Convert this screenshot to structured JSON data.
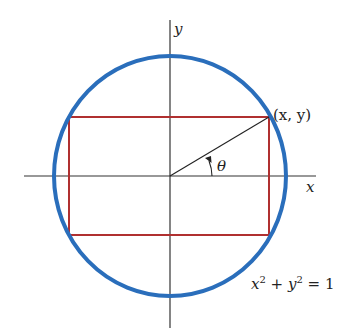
{
  "diagram": {
    "type": "geometry",
    "colors": {
      "circle": "#2a6ebb",
      "rectangle": "#b03030",
      "axes": "#333333",
      "radius_line": "#222222",
      "text": "#222222"
    },
    "labels": {
      "y_axis": "y",
      "x_axis": "x",
      "point": "(x, y)",
      "angle": "θ",
      "equation_x": "x",
      "equation_exp1": "2",
      "equation_plus": " + ",
      "equation_y": "y",
      "equation_exp2": "2",
      "equation_rest": " = 1"
    }
  }
}
